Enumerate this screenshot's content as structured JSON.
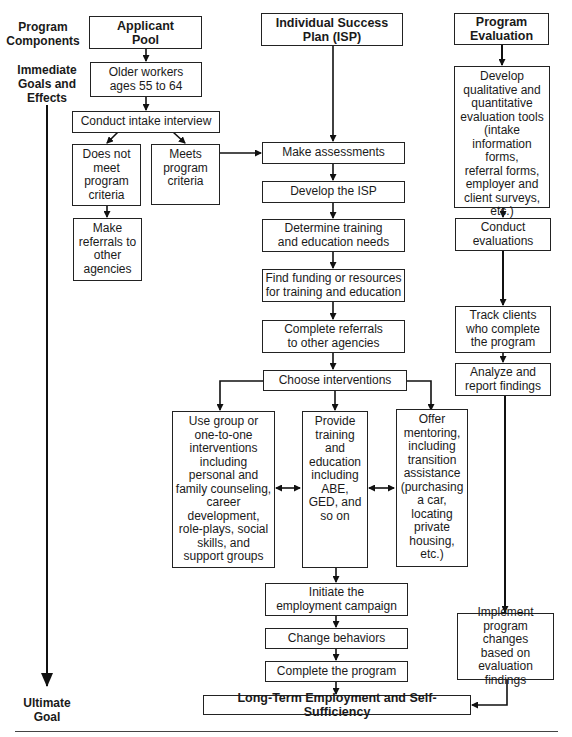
{
  "side_labels": {
    "program_components": "Program\nComponents",
    "immediate_goals": "Immediate\nGoals and\nEffects",
    "ultimate_goal": "Ultimate\nGoal"
  },
  "columns": {
    "applicant_pool": {
      "header": "Applicant\nPool",
      "older_workers": "Older workers\nages 55 to 64",
      "intake": "Conduct intake interview",
      "does_not_meet": "Does not\nmeet\nprogram\ncriteria",
      "meets": "Meets\nprogram\ncriteria",
      "make_referrals": "Make\nreferrals to\nother\nagencies"
    },
    "isp": {
      "header": "Individual Success\nPlan (ISP)",
      "make_assessments": "Make assessments",
      "develop_isp": "Develop the ISP",
      "determine_needs": "Determine training\nand education needs",
      "find_funding": "Find funding or resources\nfor training and education",
      "complete_referrals": "Complete referrals\nto other agencies",
      "choose_interventions": "Choose interventions",
      "interventions": [
        "Use group or\none-to-one\ninterventions\nincluding\npersonal and\nfamily counseling,\ncareer\ndevelopment,\nrole-plays, social\nskills, and\nsupport groups",
        "Provide\ntraining\nand\neducation\nincluding\nABE,\nGED, and\nso on",
        "Offer\nmentoring,\nincluding\ntransition\nassistance\n(purchasing\na car,\nlocating\nprivate\nhousing,\netc.)"
      ],
      "initiate_campaign": "Initiate the\nemployment campaign",
      "change_behaviors": "Change behaviors",
      "complete_program": "Complete the program"
    },
    "evaluation": {
      "header": "Program\nEvaluation",
      "develop_tools": "Develop\nqualitative and\nquantitative\nevaluation tools\n(intake\ninformation forms,\nreferral forms,\nemployer and\nclient surveys,\netc.)",
      "conduct_evaluations": "Conduct\nevaluations",
      "track_clients": "Track clients\nwho complete\nthe program",
      "analyze_report": "Analyze and\nreport findings",
      "implement_changes": "Implement\nprogram changes\nbased on\nevaluation findings"
    }
  },
  "ultimate": {
    "goal": "Long-Term Employment and Self-Sufficiency"
  }
}
